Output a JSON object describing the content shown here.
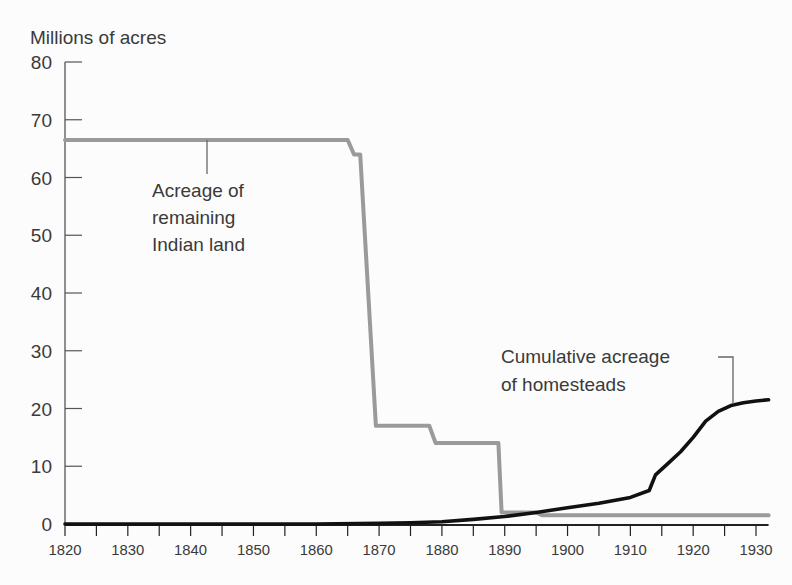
{
  "chart_data": {
    "type": "line",
    "title": "",
    "ylabel": "Millions of acres",
    "xlabel": "",
    "ylim": [
      0,
      80
    ],
    "xlim": [
      1820,
      1932
    ],
    "yticks": [
      0,
      10,
      20,
      30,
      40,
      50,
      60,
      70,
      80
    ],
    "xticks": [
      1820,
      1830,
      1840,
      1850,
      1860,
      1870,
      1880,
      1890,
      1900,
      1910,
      1920,
      1930
    ],
    "grid": false,
    "legend": "none (direct annotations)",
    "colors": {
      "indian_land": "#9a9a9a",
      "homesteads": "#111111",
      "axis": "#555555"
    },
    "series": [
      {
        "name": "Acreage of remaining Indian land",
        "label_lines": [
          "Acreage of",
          "remaining",
          "Indian land"
        ],
        "x": [
          1820,
          1865,
          1866,
          1867,
          1869.5,
          1878,
          1879,
          1889,
          1889.5,
          1895,
          1896,
          1932
        ],
        "values": [
          66.5,
          66.5,
          64,
          64,
          17,
          17,
          14,
          14,
          2,
          2,
          1.5,
          1.5
        ]
      },
      {
        "name": "Cumulative acreage of homesteads",
        "label_lines": [
          "Cumulative acreage",
          "of homesteads"
        ],
        "x": [
          1820,
          1860,
          1870,
          1875,
          1880,
          1885,
          1890,
          1895,
          1900,
          1905,
          1910,
          1913,
          1914,
          1916,
          1918,
          1920,
          1922,
          1924,
          1926,
          1928,
          1930,
          1932
        ],
        "values": [
          0,
          0,
          0.1,
          0.2,
          0.4,
          0.8,
          1.3,
          2,
          2.8,
          3.6,
          4.6,
          5.8,
          8.5,
          10.5,
          12.5,
          15,
          17.8,
          19.5,
          20.5,
          21,
          21.3,
          21.5
        ]
      }
    ]
  }
}
